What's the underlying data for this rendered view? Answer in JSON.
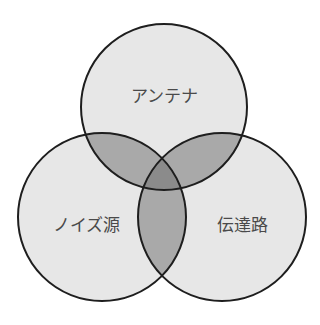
{
  "diagram": {
    "type": "venn",
    "sets": [
      {
        "id": "antenna",
        "label": "アンテナ",
        "cx": 164,
        "cy": 107,
        "r": 83,
        "label_x": 164,
        "label_y": 102
      },
      {
        "id": "noise_source",
        "label": "ノイズ源",
        "cx": 102,
        "cy": 217,
        "r": 84,
        "label_x": 86,
        "label_y": 231
      },
      {
        "id": "transmission_path",
        "label": "伝達路",
        "cx": 222,
        "cy": 217,
        "r": 84,
        "label_x": 242,
        "label_y": 231
      }
    ],
    "colors": {
      "single": "#e7e7e7",
      "double": "#a9a9a9",
      "triple": "#8b8b8b",
      "stroke": "#1e1e1e",
      "label": "#4a4a4a",
      "background": "#ffffff"
    }
  }
}
